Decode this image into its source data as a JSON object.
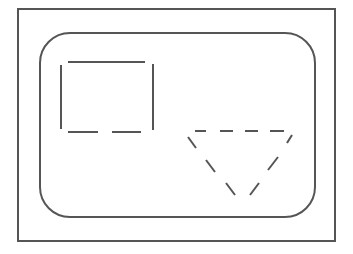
{
  "diagram": {
    "stroke_color": "#555555",
    "background": "#ffffff",
    "outer_frame": {
      "x": 18,
      "y": 9,
      "w": 317,
      "h": 232
    },
    "rounded_panel": {
      "x": 40,
      "y": 33,
      "w": 275,
      "h": 184,
      "radius": 30
    },
    "shapes": [
      {
        "type": "rectangle",
        "style": "partially-dashed",
        "x": 61,
        "y": 62,
        "w": 92,
        "h": 69
      },
      {
        "type": "inverted-triangle",
        "style": "dashed",
        "top_left": [
          188,
          131
        ],
        "top_right": [
          292,
          131
        ],
        "apex": [
          238,
          197
        ]
      }
    ]
  }
}
